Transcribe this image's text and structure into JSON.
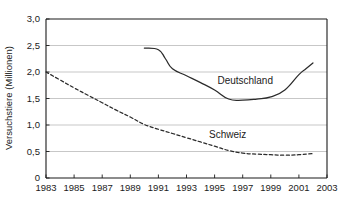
{
  "chart_data": {
    "type": "line",
    "title": "",
    "xlabel": "",
    "ylabel": "Versuchstiere (Millionen)",
    "xlim": [
      1983,
      2003
    ],
    "ylim": [
      0,
      3.0
    ],
    "grid": true,
    "legend_position": "inline-annotations",
    "x_tick_labels": [
      "1983",
      "1985",
      "1987",
      "1989",
      "1991",
      "1993",
      "1995",
      "1997",
      "1999",
      "2001",
      "2003"
    ],
    "x_tick_values": [
      1983,
      1985,
      1987,
      1989,
      1991,
      1993,
      1995,
      1997,
      1999,
      2001,
      2003
    ],
    "y_tick_labels": [
      "0",
      "0,5",
      "1,0",
      "1,5",
      "2,0",
      "2,5",
      "3,0"
    ],
    "y_tick_values": [
      0,
      0.5,
      1.0,
      1.5,
      2.0,
      2.5,
      3.0
    ],
    "series": [
      {
        "name": "Deutschland",
        "style": "solid",
        "color": "#2b2b2b",
        "annotation": "Deutschland",
        "x": [
          1990,
          1991,
          1991.5,
          1992,
          1993,
          1994,
          1995,
          1996,
          1997,
          1998,
          1999,
          2000,
          2001,
          2001.5,
          2002
        ],
        "values": [
          2.45,
          2.42,
          2.25,
          2.06,
          1.93,
          1.8,
          1.66,
          1.49,
          1.47,
          1.49,
          1.53,
          1.66,
          1.95,
          2.06,
          2.17
        ]
      },
      {
        "name": "Schweiz",
        "style": "dashed",
        "color": "#2b2b2b",
        "annotation": "Schweiz",
        "x": [
          1983,
          1984,
          1985,
          1986,
          1987,
          1988,
          1989,
          1990,
          1991,
          1992,
          1993,
          1994,
          1995,
          1996,
          1997,
          1998,
          1999,
          2000,
          2001,
          2002
        ],
        "values": [
          2.0,
          1.85,
          1.7,
          1.56,
          1.42,
          1.28,
          1.15,
          1.01,
          0.92,
          0.84,
          0.76,
          0.68,
          0.6,
          0.52,
          0.47,
          0.45,
          0.44,
          0.43,
          0.44,
          0.46
        ]
      }
    ],
    "annotations": [
      {
        "text": "Deutschland",
        "x": 1995.2,
        "y": 1.78
      },
      {
        "text": "Schweiz",
        "x": 1994.6,
        "y": 0.75
      }
    ],
    "colors": {
      "axis": "#1b1b1b",
      "grid": "#b9b9b9",
      "line": "#2b2b2b",
      "background": "#ffffff"
    }
  }
}
